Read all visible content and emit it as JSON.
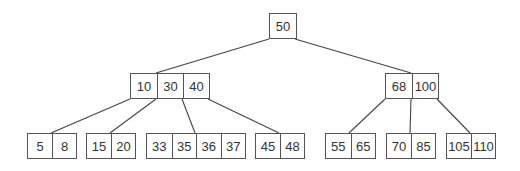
{
  "diagram": {
    "type": "b-tree",
    "nodes": [
      {
        "id": "root",
        "keys": [
          "50"
        ],
        "x": 269,
        "y": 13,
        "cell_w": 26
      },
      {
        "id": "l2a",
        "keys": [
          "10",
          "30",
          "40"
        ],
        "x": 130,
        "y": 73,
        "cell_w": 26
      },
      {
        "id": "l2b",
        "keys": [
          "68",
          "100"
        ],
        "x": 385,
        "y": 73,
        "cell_w": 26
      },
      {
        "id": "leaf1",
        "keys": [
          "5",
          "8"
        ],
        "x": 27,
        "y": 133,
        "cell_w": 24
      },
      {
        "id": "leaf2",
        "keys": [
          "15",
          "20"
        ],
        "x": 86,
        "y": 133,
        "cell_w": 24
      },
      {
        "id": "leaf3",
        "keys": [
          "33",
          "35",
          "36",
          "37"
        ],
        "x": 146,
        "y": 133,
        "cell_w": 24.5
      },
      {
        "id": "leaf4",
        "keys": [
          "45",
          "48"
        ],
        "x": 255,
        "y": 133,
        "cell_w": 24
      },
      {
        "id": "leaf5",
        "keys": [
          "55",
          "65"
        ],
        "x": 325,
        "y": 133,
        "cell_w": 24.5
      },
      {
        "id": "leaf6",
        "keys": [
          "70",
          "85"
        ],
        "x": 386,
        "y": 133,
        "cell_w": 24
      },
      {
        "id": "leaf7",
        "keys": [
          "105",
          "110"
        ],
        "x": 446,
        "y": 133,
        "cell_w": 24
      }
    ],
    "edges": [
      {
        "from": [
          269,
          39
        ],
        "to": [
          156,
          73
        ]
      },
      {
        "from": [
          295,
          39
        ],
        "to": [
          411,
          73
        ]
      },
      {
        "from": [
          130,
          99
        ],
        "to": [
          51,
          133
        ]
      },
      {
        "from": [
          156,
          99
        ],
        "to": [
          110,
          133
        ]
      },
      {
        "from": [
          182,
          99
        ],
        "to": [
          195,
          133
        ]
      },
      {
        "from": [
          208,
          99
        ],
        "to": [
          279,
          133
        ]
      },
      {
        "from": [
          385,
          99
        ],
        "to": [
          349,
          133
        ]
      },
      {
        "from": [
          411,
          99
        ],
        "to": [
          410,
          133
        ]
      },
      {
        "from": [
          437,
          99
        ],
        "to": [
          470,
          133
        ]
      }
    ]
  }
}
